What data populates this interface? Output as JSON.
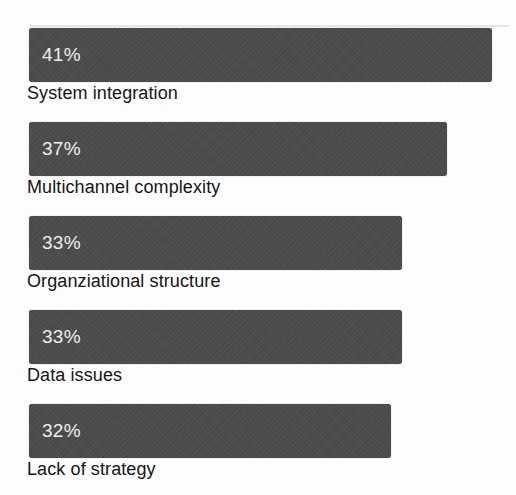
{
  "chart_data": {
    "type": "bar",
    "orientation": "horizontal",
    "categories": [
      "System integration",
      "Multichannel complexity",
      "Organziational structure",
      "Data issues",
      "Lack of strategy"
    ],
    "values": [
      41,
      37,
      33,
      33,
      32
    ],
    "value_labels": [
      "41%",
      "37%",
      "33%",
      "33%",
      "32%"
    ],
    "unit": "%",
    "xlim": [
      0,
      43
    ],
    "grid": false,
    "legend": false,
    "bar_color": "#4b4b4b",
    "value_label_color": "#efefef",
    "category_label_color": "#151515",
    "background_color": "#fdfdfd"
  }
}
